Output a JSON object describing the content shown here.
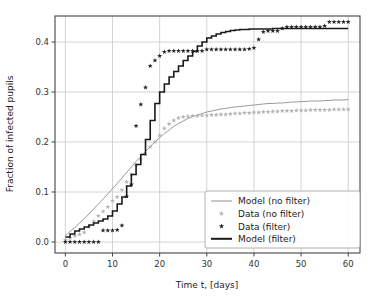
{
  "chart_data": {
    "type": "line",
    "title": "",
    "xlabel": "Time t, [days]",
    "ylabel": "Fraction of infected pupils",
    "xlim": [
      -2.2,
      62.5
    ],
    "ylim": [
      -0.022,
      0.452
    ],
    "xticks": [
      0,
      10,
      20,
      30,
      40,
      50,
      60
    ],
    "xtick_labels": [
      "0",
      "10",
      "20",
      "30",
      "40",
      "50",
      "60"
    ],
    "yticks": [
      0.0,
      0.1,
      0.2,
      0.3,
      0.4
    ],
    "ytick_labels": [
      "0.0",
      "0.1",
      "0.2",
      "0.3",
      "0.4"
    ],
    "grid": true,
    "grid_color": "#c8c8c8",
    "legend_position": "lower right",
    "series": [
      {
        "name": "Model (no filter)",
        "kind": "line",
        "color": "#9a9a9a",
        "linewidth": 1.0,
        "x": [
          0,
          1,
          2,
          3,
          4,
          5,
          6,
          7,
          8,
          9,
          10,
          11,
          12,
          13,
          14,
          15,
          16,
          17,
          18,
          19,
          20,
          21,
          22,
          23,
          24,
          25,
          26,
          27,
          28,
          29,
          30,
          31,
          32,
          33,
          34,
          35,
          36,
          37,
          38,
          39,
          40,
          41,
          42,
          43,
          44,
          45,
          46,
          47,
          48,
          49,
          50,
          51,
          52,
          53,
          54,
          55,
          56,
          57,
          58,
          59,
          60
        ],
        "y": [
          0.013,
          0.021,
          0.029,
          0.038,
          0.047,
          0.056,
          0.066,
          0.076,
          0.086,
          0.096,
          0.107,
          0.117,
          0.128,
          0.139,
          0.15,
          0.161,
          0.171,
          0.181,
          0.191,
          0.2,
          0.209,
          0.217,
          0.224,
          0.231,
          0.237,
          0.242,
          0.247,
          0.251,
          0.254,
          0.257,
          0.26,
          0.262,
          0.264,
          0.266,
          0.267,
          0.269,
          0.27,
          0.271,
          0.272,
          0.273,
          0.274,
          0.275,
          0.276,
          0.277,
          0.277,
          0.278,
          0.278,
          0.279,
          0.28,
          0.28,
          0.281,
          0.281,
          0.282,
          0.282,
          0.282,
          0.283,
          0.283,
          0.284,
          0.284,
          0.284,
          0.285
        ]
      },
      {
        "name": "Data (no filter)",
        "kind": "markers",
        "marker": "star",
        "color": "#b4b4b4",
        "x": [
          0,
          1,
          2,
          3,
          4,
          5,
          6,
          7,
          8,
          9,
          10,
          11,
          12,
          13,
          14,
          15,
          16,
          17,
          18,
          19,
          20,
          21,
          22,
          23,
          24,
          25,
          26,
          27,
          28,
          29,
          30,
          31,
          32,
          33,
          34,
          35,
          36,
          37,
          38,
          39,
          40,
          41,
          42,
          43,
          44,
          45,
          46,
          47,
          48,
          49,
          50,
          51,
          52,
          53,
          54,
          55,
          56,
          57,
          58,
          59,
          60
        ],
        "y": [
          0.004,
          0.008,
          0.012,
          0.015,
          0.019,
          0.03,
          0.041,
          0.052,
          0.061,
          0.07,
          0.082,
          0.09,
          0.104,
          0.12,
          0.135,
          0.154,
          0.165,
          0.175,
          0.19,
          0.2,
          0.213,
          0.227,
          0.236,
          0.243,
          0.248,
          0.25,
          0.251,
          0.252,
          0.252,
          0.253,
          0.253,
          0.254,
          0.254,
          0.255,
          0.255,
          0.256,
          0.257,
          0.257,
          0.258,
          0.258,
          0.259,
          0.259,
          0.26,
          0.26,
          0.261,
          0.261,
          0.262,
          0.262,
          0.262,
          0.263,
          0.263,
          0.263,
          0.264,
          0.264,
          0.264,
          0.264,
          0.264,
          0.265,
          0.265,
          0.265,
          0.265
        ]
      },
      {
        "name": "Data (filter)",
        "kind": "markers",
        "marker": "star",
        "color": "#2a2a2a",
        "x": [
          0,
          1,
          2,
          3,
          4,
          5,
          6,
          7,
          8,
          9,
          10,
          11,
          12,
          13,
          14,
          15,
          16,
          17,
          18,
          19,
          20,
          21,
          22,
          23,
          24,
          25,
          26,
          27,
          28,
          29,
          30,
          31,
          32,
          33,
          34,
          35,
          36,
          37,
          38,
          39,
          40,
          41,
          42,
          43,
          44,
          45,
          46,
          47,
          48,
          49,
          50,
          51,
          52,
          53,
          54,
          55,
          56,
          57,
          58,
          59,
          60
        ],
        "y": [
          0.0,
          0.0,
          0.0,
          0.0,
          0.0,
          0.0,
          0.0,
          0.0,
          0.023,
          0.023,
          0.023,
          0.024,
          0.033,
          0.091,
          0.115,
          0.232,
          0.275,
          0.309,
          0.352,
          0.363,
          0.372,
          0.38,
          0.382,
          0.382,
          0.382,
          0.382,
          0.382,
          0.382,
          0.382,
          0.382,
          0.385,
          0.385,
          0.385,
          0.385,
          0.385,
          0.385,
          0.385,
          0.385,
          0.385,
          0.386,
          0.388,
          0.405,
          0.42,
          0.422,
          0.422,
          0.422,
          0.427,
          0.43,
          0.43,
          0.43,
          0.43,
          0.43,
          0.43,
          0.43,
          0.43,
          0.432,
          0.44,
          0.44,
          0.44,
          0.44,
          0.44
        ]
      },
      {
        "name": "Model (filter)",
        "kind": "step",
        "color": "#1a1a1a",
        "linewidth": 1.6,
        "x": [
          0,
          1,
          2,
          3,
          4,
          5,
          6,
          7,
          8,
          9,
          10,
          11,
          12,
          13,
          14,
          15,
          16,
          17,
          18,
          19,
          20,
          21,
          22,
          23,
          24,
          25,
          26,
          27,
          28,
          29,
          30,
          31,
          32,
          33,
          34,
          35,
          36,
          37,
          38,
          39,
          40,
          41,
          42,
          43,
          44,
          45,
          46,
          47,
          48,
          49,
          50,
          51,
          52,
          53,
          54,
          55,
          56,
          57,
          58,
          59,
          60
        ],
        "y": [
          0.01,
          0.016,
          0.022,
          0.026,
          0.03,
          0.034,
          0.038,
          0.042,
          0.046,
          0.052,
          0.062,
          0.076,
          0.09,
          0.112,
          0.135,
          0.155,
          0.175,
          0.205,
          0.243,
          0.277,
          0.3,
          0.316,
          0.33,
          0.341,
          0.352,
          0.363,
          0.372,
          0.381,
          0.392,
          0.4,
          0.408,
          0.412,
          0.416,
          0.419,
          0.421,
          0.423,
          0.424,
          0.425,
          0.425,
          0.426,
          0.426,
          0.426,
          0.426,
          0.426,
          0.427,
          0.427,
          0.427,
          0.427,
          0.427,
          0.427,
          0.427,
          0.427,
          0.427,
          0.427,
          0.427,
          0.427,
          0.427,
          0.427,
          0.427,
          0.427,
          0.427
        ]
      }
    ]
  },
  "legend": {
    "entries": [
      {
        "label": "Model (no filter)",
        "type": "line",
        "color": "#9a9a9a"
      },
      {
        "label": "Data (no filter)",
        "type": "star",
        "color": "#b4b4b4"
      },
      {
        "label": "Data (filter)",
        "type": "star",
        "color": "#2a2a2a"
      },
      {
        "label": "Model (filter)",
        "type": "line-thick",
        "color": "#1a1a1a"
      }
    ]
  },
  "colors": {
    "axis": "#444444",
    "grid": "#c8c8c8",
    "background": "#ffffff",
    "model_no_filter": "#9a9a9a",
    "data_no_filter": "#b4b4b4",
    "data_filter": "#2a2a2a",
    "model_filter": "#1a1a1a"
  }
}
